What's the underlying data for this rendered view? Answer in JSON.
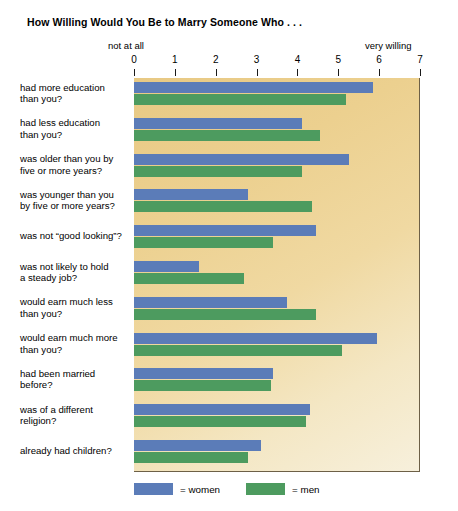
{
  "chart_data": {
    "type": "bar",
    "orientation": "horizontal",
    "title": "How Willing Would You Be to Marry Someone Who . . .",
    "xlabel": "",
    "ylabel": "",
    "xlim": [
      0,
      7
    ],
    "xticks": [
      0,
      1,
      2,
      3,
      4,
      5,
      6,
      7
    ],
    "xtick_labels": [
      "0",
      "1",
      "2",
      "3",
      "4",
      "5",
      "6",
      "7"
    ],
    "axis_low_label": "not at all",
    "axis_high_label": "very willing",
    "grid": false,
    "legend_position": "bottom-left",
    "categories": [
      "had more education than you?",
      "had less education than you?",
      "was older than you by five or more years?",
      "was younger than you by five or more years?",
      "was not “good looking”?",
      "was not likely to hold a steady job?",
      "would earn much less than you?",
      "would earn much more than you?",
      "had been married before?",
      "was of a different religion?",
      "already had children?"
    ],
    "category_lines": [
      [
        "had more education",
        "than you?"
      ],
      [
        "had less education",
        "than you?"
      ],
      [
        "was older than you by",
        "five or more years?"
      ],
      [
        "was younger than you",
        "by five or more years?"
      ],
      [
        "was not “good looking”?"
      ],
      [
        "was not likely to hold",
        "a steady job?"
      ],
      [
        "would earn much less",
        "than you?"
      ],
      [
        "would earn much more",
        "than you?"
      ],
      [
        "had been married",
        "before?"
      ],
      [
        "was of a different",
        "religion?"
      ],
      [
        "already had children?"
      ]
    ],
    "series": [
      {
        "name": "= women",
        "key": "women",
        "color": "#5b7cb8",
        "values": [
          5.85,
          4.1,
          5.25,
          2.8,
          4.45,
          1.6,
          3.75,
          5.95,
          3.4,
          4.3,
          3.1
        ]
      },
      {
        "name": "= men",
        "key": "men",
        "color": "#4d9b5f",
        "values": [
          5.2,
          4.55,
          4.1,
          4.35,
          3.4,
          2.7,
          4.45,
          5.1,
          3.35,
          4.2,
          2.8
        ]
      }
    ]
  },
  "colors": {
    "plot_background_light": "#f7f0dc",
    "plot_background_dark": "#e8c984",
    "women": "#5b7cb8",
    "men": "#4d9b5f",
    "axis": "#1a1a1a",
    "text": "#000000"
  }
}
